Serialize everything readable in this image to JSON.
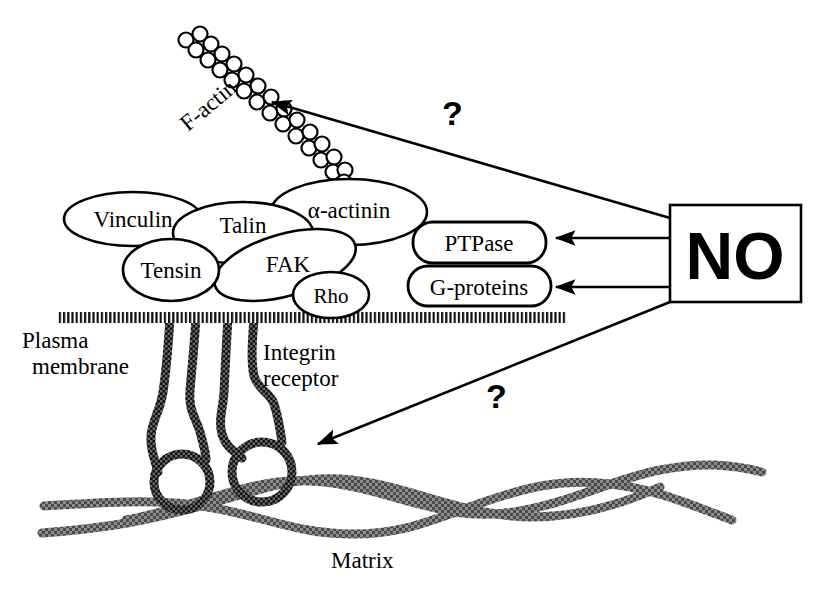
{
  "figure": {
    "background_color": "#ffffff",
    "ink_color": "#000000",
    "matrix_color": "#555555"
  },
  "cytoskeleton": {
    "actin_label": "F-actin",
    "actin_bead_count": 27
  },
  "plaque_proteins": [
    {
      "id": "vinculin",
      "label": "Vinculin",
      "shape": "ellipse"
    },
    {
      "id": "talin",
      "label": "Talin",
      "shape": "ellipse"
    },
    {
      "id": "alpha-actinin",
      "label": "α-actinin",
      "shape": "ellipse"
    },
    {
      "id": "tensin",
      "label": "Tensin",
      "shape": "ellipse"
    },
    {
      "id": "fak",
      "label": "FAK",
      "shape": "ellipse"
    },
    {
      "id": "rho",
      "label": "Rho",
      "shape": "ellipse"
    }
  ],
  "effectors": [
    {
      "id": "ptpase",
      "label": "PTPase",
      "shape": "stadium"
    },
    {
      "id": "g-proteins",
      "label": "G-proteins",
      "shape": "stadium"
    }
  ],
  "source_box": {
    "label": "NO",
    "shape": "rectangle"
  },
  "membrane": {
    "label_line1": "Plasma",
    "label_line2": "membrane",
    "style": "hatched-band"
  },
  "receptor": {
    "label_line1": "Integrin",
    "label_line2": "receptor"
  },
  "matrix": {
    "label": "Matrix",
    "fiber_count": 3
  },
  "annotations": {
    "question_mark_upper": "?",
    "question_mark_lower": "?"
  },
  "arrows": [
    {
      "id": "no-to-actin",
      "from": "NO",
      "to": "F-actin",
      "marker": "?"
    },
    {
      "id": "no-to-ptpase",
      "from": "NO",
      "to": "PTPase",
      "marker": ""
    },
    {
      "id": "no-to-gproteins",
      "from": "NO",
      "to": "G-proteins",
      "marker": ""
    },
    {
      "id": "no-to-integrin",
      "from": "NO",
      "to": "Integrin receptor",
      "marker": "?"
    }
  ]
}
